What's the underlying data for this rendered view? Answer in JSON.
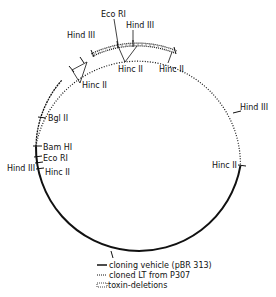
{
  "diagram": {
    "type": "plasmid-restriction-map",
    "colors": {
      "ink": "#111111",
      "background": "#ffffff"
    },
    "sites": [
      {
        "id": "hinc2-right",
        "label": "Hinc II",
        "x": 242,
        "y": 165,
        "lx": 206,
        "ly": 168
      },
      {
        "id": "hind3-right",
        "label": "Hind III",
        "x": 237,
        "y": 113,
        "lx": 240,
        "ly": 110
      },
      {
        "id": "hinc2-top-right",
        "label": "Hinc II",
        "x": 175,
        "y": 50,
        "lx": 160,
        "ly": 72
      },
      {
        "id": "hind3-top",
        "label": "Hind III",
        "x": 133,
        "y": 43,
        "lx": 126,
        "ly": 28
      },
      {
        "id": "eco-ri-top",
        "label": "Eco RI",
        "x": 117,
        "y": 45,
        "lx": 101,
        "ly": 17
      },
      {
        "id": "hinc2-top-center",
        "label": "Hinc II",
        "x": 128,
        "y": 68,
        "lx": 118,
        "ly": 72
      },
      {
        "id": "hind3-top-left",
        "label": "Hind III",
        "x": 92,
        "y": 54,
        "lx": 68,
        "ly": 38
      },
      {
        "id": "hinc2-top-left",
        "label": "Hinc II",
        "x": 87,
        "y": 85,
        "lx": 82,
        "ly": 88
      },
      {
        "id": "bgl2",
        "label": "Bgl II",
        "x": 42,
        "y": 117,
        "lx": 48,
        "ly": 121
      },
      {
        "id": "bam-hi",
        "label": "Bam HI",
        "x": 37,
        "y": 146,
        "lx": 43,
        "ly": 150
      },
      {
        "id": "eco-ri-left",
        "label": "Eco RI",
        "x": 38,
        "y": 157,
        "lx": 43,
        "ly": 162
      },
      {
        "id": "hind3-left",
        "label": "Hind III",
        "x": 39,
        "y": 163,
        "lx": 7,
        "ly": 172
      },
      {
        "id": "hinc2-left",
        "label": "Hinc II",
        "x": 40,
        "y": 169,
        "lx": 45,
        "ly": 174
      }
    ],
    "legend": {
      "items": [
        {
          "key": "solid",
          "label": "cloning vehicle (pBR 313)"
        },
        {
          "key": "dotted",
          "label": "cloned LT from P307"
        },
        {
          "key": "hatched",
          "label": "toxin-deletions"
        }
      ]
    }
  }
}
